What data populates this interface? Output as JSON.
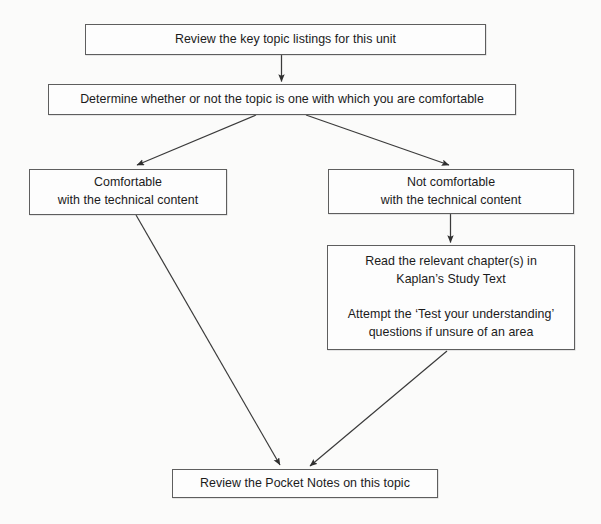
{
  "diagram": {
    "type": "flowchart",
    "background_color": "#fbfbfa",
    "box_border_color": "#5e5e5e",
    "box_fill_color": "#fdfdfd",
    "arrow_color": "#3a3a3a",
    "text_color": "#1b1b1b",
    "nodes": [
      {
        "id": "review-key-topics",
        "text": "Review the key topic listings for this unit"
      },
      {
        "id": "determine-comfort",
        "text": "Determine whether or not the topic is one with which you are comfortable"
      },
      {
        "id": "comfortable",
        "text": "Comfortable\nwith the technical content"
      },
      {
        "id": "not-comfortable",
        "text": "Not comfortable\nwith the technical content"
      },
      {
        "id": "read-chapters",
        "text": "Read the relevant chapter(s) in\nKaplan’s Study Text\n\nAttempt the ‘Test your understanding’\nquestions if unsure of an area"
      },
      {
        "id": "review-pocket-notes",
        "text": "Review the Pocket Notes on this topic"
      }
    ],
    "edges": [
      {
        "id": "edge-topics-to-determine",
        "from": "review-key-topics",
        "to": "determine-comfort",
        "style": "vertical-arrow"
      },
      {
        "id": "edge-determine-to-comfortable",
        "from": "determine-comfort",
        "to": "comfortable",
        "style": "diagonal-arrow"
      },
      {
        "id": "edge-determine-to-not-comfortable",
        "from": "determine-comfort",
        "to": "not-comfortable",
        "style": "diagonal-arrow"
      },
      {
        "id": "edge-notcomfortable-to-read",
        "from": "not-comfortable",
        "to": "read-chapters",
        "style": "vertical-arrow"
      },
      {
        "id": "edge-comfortable-to-pocket",
        "from": "comfortable",
        "to": "review-pocket-notes",
        "style": "diagonal-arrow"
      },
      {
        "id": "edge-read-to-pocket",
        "from": "read-chapters",
        "to": "review-pocket-notes",
        "style": "diagonal-arrow"
      }
    ]
  }
}
